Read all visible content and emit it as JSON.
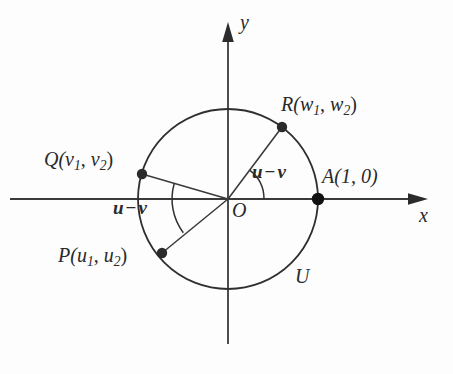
{
  "figure": {
    "background_color": "#fdfdfd",
    "stroke_color": "#2f2f2f"
  },
  "axes": {
    "x_label": "x",
    "y_label": "y",
    "origin_label": "O"
  },
  "circle": {
    "label": "U",
    "center_x": 228,
    "center_y": 199,
    "radius": 90
  },
  "points": [
    {
      "id": "R",
      "label_prefix": "R(",
      "var1": "w",
      "sub1": "1",
      "separator": ", ",
      "var2": "w",
      "sub2": "2",
      "label_suffix": ")",
      "angle_deg": 53,
      "x": 282,
      "y": 127
    },
    {
      "id": "Q",
      "label_prefix": "Q(",
      "var1": "v",
      "sub1": "1",
      "separator": ", ",
      "var2": "v",
      "sub2": "2",
      "label_suffix": ")",
      "angle_deg": 164,
      "x": 142,
      "y": 174
    },
    {
      "id": "P",
      "label_prefix": "P(",
      "var1": "u",
      "sub1": "1",
      "separator": ", ",
      "var2": "u",
      "sub2": "2",
      "label_suffix": ")",
      "angle_deg": 217,
      "x": 162,
      "y": 253
    },
    {
      "id": "A",
      "label": "A(1, 0)",
      "angle_deg": 0,
      "x": 318,
      "y": 199
    }
  ],
  "angles": [
    {
      "id": "angle-right",
      "var1": "u",
      "operator": "−",
      "var2": "v",
      "from_deg": 0,
      "to_deg": 53,
      "arc_radius": 36
    },
    {
      "id": "angle-left",
      "var1": "u",
      "operator": "−",
      "var2": "v",
      "from_deg": 164,
      "to_deg": 217,
      "arc_radius": 56
    }
  ]
}
